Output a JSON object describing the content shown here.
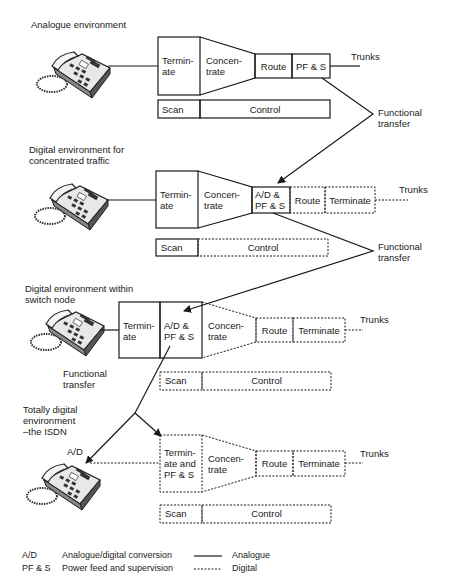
{
  "sections": [
    {
      "title": "Analogue environment",
      "blocks": [
        "Termin-\nate",
        "Concen-\ntrate",
        "Route",
        "PF & S"
      ],
      "trunks": "Trunks",
      "scan": "Scan",
      "control": "Control",
      "transfer": "Functional\ntransfer"
    },
    {
      "title": "Digital environment for\nconcentrated traffic",
      "blocks": [
        "Termin-\nate",
        "Concen-\ntrate",
        "A/D &\nPF & S",
        "Route",
        "Terminate"
      ],
      "trunks": "Trunks",
      "scan": "Scan",
      "control": "Control",
      "transfer": "Functional\ntransfer"
    },
    {
      "title": "Digital environment within\nswitch node",
      "blocks": [
        "Termin-\nate",
        "A/D &\nPF & S",
        "Concen-\ntrate",
        "Route",
        "Terminate"
      ],
      "trunks": "Trunks",
      "scan": "Scan",
      "control": "Control",
      "transfer": "Functional\ntransfer"
    },
    {
      "title": "Totally digital\nenvironment\n–the ISDN",
      "phone_label": "A/D",
      "blocks": [
        "Termin-\nate and\nPF & S",
        "Concen-\ntrate",
        "Route",
        "Terminate"
      ],
      "trunks": "Trunks",
      "scan": "Scan",
      "control": "Control"
    }
  ],
  "legend": {
    "abbreviations": [
      {
        "abbr": "A/D",
        "meaning": "Analogue/digital conversion"
      },
      {
        "abbr": "PF & S",
        "meaning": "Power feed and supervision"
      }
    ],
    "line_styles": [
      {
        "style": "solid",
        "label": "Analogue"
      },
      {
        "style": "dashed",
        "label": "Digital"
      }
    ]
  }
}
